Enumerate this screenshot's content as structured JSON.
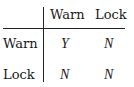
{
  "table": {
    "column_headers": [
      "Warn",
      "Lock"
    ],
    "rows": [
      {
        "label": "Warn",
        "values": [
          "Y",
          "N"
        ]
      },
      {
        "label": "Lock",
        "values": [
          "N",
          "N"
        ]
      }
    ]
  }
}
